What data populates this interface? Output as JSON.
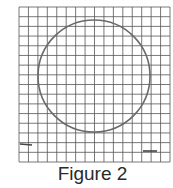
{
  "figure": {
    "caption": "Figure 2",
    "grid": {
      "columns": 16,
      "rows": 16,
      "line_color": "#555555"
    },
    "circle": {
      "stroke_color": "#6a6a6a"
    },
    "marks": [
      {
        "name": "left-tick-mark"
      },
      {
        "name": "right-tick-mark"
      }
    ]
  }
}
